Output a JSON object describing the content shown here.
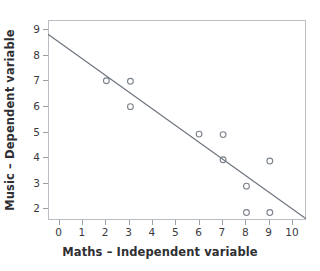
{
  "chart_data": {
    "type": "scatter",
    "title": "",
    "xlabel": "Maths – Independent variable",
    "ylabel": "Music – Dependent variable",
    "xlim": [
      -0.45,
      10.6
    ],
    "ylim": [
      1.55,
      9.35
    ],
    "xticks": [
      "0",
      "1",
      "2",
      "3",
      "4",
      "5",
      "6",
      "7",
      "8",
      "9",
      "10"
    ],
    "yticks": [
      "2",
      "3",
      "4",
      "5",
      "6",
      "7",
      "8",
      "9"
    ],
    "grid": false,
    "legend": false,
    "marker_shape": "open-circle",
    "marker_color": "#7b828c",
    "line_color": "#6e757f",
    "points": [
      {
        "x": 2.05,
        "y": 6.98
      },
      {
        "x": 3.08,
        "y": 6.96
      },
      {
        "x": 3.08,
        "y": 5.97
      },
      {
        "x": 6.02,
        "y": 4.9
      },
      {
        "x": 7.05,
        "y": 4.88
      },
      {
        "x": 7.05,
        "y": 3.9
      },
      {
        "x": 8.05,
        "y": 2.87
      },
      {
        "x": 9.05,
        "y": 3.85
      },
      {
        "x": 8.05,
        "y": 1.84
      },
      {
        "x": 9.05,
        "y": 1.84
      }
    ],
    "trendline": {
      "x_start": -0.45,
      "y_start": 8.79,
      "x_end": 10.6,
      "y_end": 1.6
    }
  },
  "axes": {
    "x_title": "Maths – Independent variable",
    "y_title": "Music – Dependent variable",
    "x_tick_labels": [
      "0",
      "1",
      "2",
      "3",
      "4",
      "5",
      "6",
      "7",
      "8",
      "9",
      "10"
    ],
    "y_tick_labels": [
      "2",
      "3",
      "4",
      "5",
      "6",
      "7",
      "8",
      "9"
    ]
  },
  "header": {
    "cropped_title": ""
  }
}
